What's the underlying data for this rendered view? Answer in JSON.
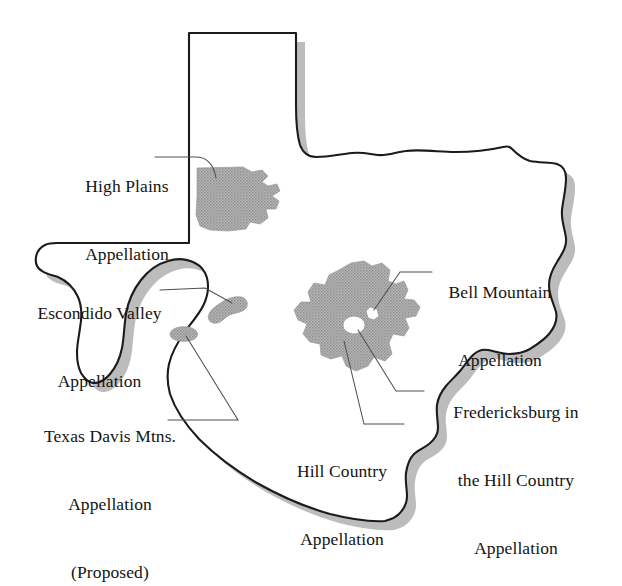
{
  "map": {
    "title": "Texas Wine Appellations",
    "region_outline_name": "Texas state boundary",
    "colors": {
      "background": "#ffffff",
      "outline": "#1a1a1a",
      "appellation_fill": "#a9a9a9",
      "appellation_hole": "#ffffff",
      "drop_shadow": "#b4b4b4",
      "leader_line": "#4a4a4a",
      "text": "#141414"
    }
  },
  "labels": {
    "high_plains": {
      "line1": "High Plains",
      "line2": "Appellation"
    },
    "escondido_valley": {
      "line1": "Escondido Valley",
      "line2": "Appellation"
    },
    "texas_davis_mtns": {
      "line1": "Texas Davis Mtns.",
      "line2": "Appellation",
      "line3": "(Proposed)"
    },
    "bell_mountain": {
      "line1": "Bell Mountain",
      "line2": "Appellation"
    },
    "fredericksburg": {
      "line1": "Fredericksburg in",
      "line2": "the Hill Country",
      "line3": "Appellation"
    },
    "hill_country": {
      "line1": "Hill Country",
      "line2": "Appellation"
    }
  },
  "appellations": [
    {
      "id": "high-plains",
      "name": "High Plains Appellation",
      "shaded": true
    },
    {
      "id": "escondido-valley",
      "name": "Escondido Valley Appellation",
      "shaded": true
    },
    {
      "id": "texas-davis-mtns",
      "name": "Texas Davis Mtns. Appellation (Proposed)",
      "shaded": true
    },
    {
      "id": "hill-country",
      "name": "Hill Country Appellation",
      "shaded": true
    },
    {
      "id": "bell-mountain",
      "name": "Bell Mountain Appellation",
      "shaded": false
    },
    {
      "id": "fredericksburg",
      "name": "Fredericksburg in the Hill Country Appellation",
      "shaded": false
    }
  ]
}
